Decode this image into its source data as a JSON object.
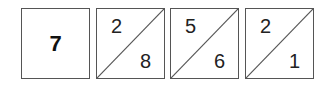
{
  "tiles": [
    {
      "type": "whole",
      "value": "7"
    },
    {
      "type": "split",
      "top": "2",
      "bottom": "8"
    },
    {
      "type": "split",
      "top": "5",
      "bottom": "6"
    },
    {
      "type": "split",
      "top": "2",
      "bottom": "1"
    }
  ],
  "colors": {
    "border": "#555555",
    "text": "#222222",
    "background": "#ffffff"
  }
}
